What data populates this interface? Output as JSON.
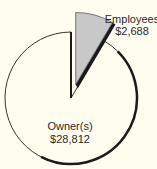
{
  "chart_data": {
    "type": "pie",
    "title": "",
    "exploded": "Employees",
    "slices": [
      {
        "label": "Owner(s)",
        "value_label": "$28,812",
        "value": 28812,
        "color": "#fffdf0"
      },
      {
        "label": "Employees",
        "value_label": "$2,688",
        "value": 2688,
        "color": "#c8c8c8"
      }
    ]
  }
}
